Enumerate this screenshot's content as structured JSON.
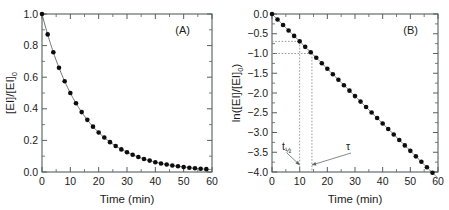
{
  "figure": {
    "background": "#ffffff",
    "marker_color": "#0d0d0d",
    "line_color": "#6b7272",
    "axis_color": "#555f5f"
  },
  "panelA": {
    "letter": "(A)",
    "xlabel": "Time (min)",
    "ylabel_main": "[EI]/[EI]",
    "ylabel_sub": "0",
    "xticklabels": [
      "0",
      "10",
      "20",
      "30",
      "40",
      "50",
      "60"
    ],
    "yticklabels": [
      "0.0",
      "0.2",
      "0.4",
      "0.6",
      "0.8",
      "1.0"
    ]
  },
  "panelB": {
    "letter": "(B)",
    "xlabel": "Time (min)",
    "ylabel_prefix": "ln([EI]/[EI]",
    "ylabel_sub": "0",
    "ylabel_suffix": ")",
    "xticklabels": [
      "0",
      "10",
      "20",
      "30",
      "40",
      "50",
      "60"
    ],
    "yticklabels": [
      "0.0",
      "-0.5",
      "-1.0",
      "-1.5",
      "-2.0",
      "-2.5",
      "-3.0",
      "-3.5",
      "-4.0"
    ],
    "annotations": [
      {
        "name": "half-life",
        "label_main": "t",
        "label_sub": "1/2",
        "value": 10.0,
        "guide_y": -0.693
      },
      {
        "name": "tau",
        "label_main": "τ",
        "label_sub": "",
        "value": 14.43,
        "guide_y": -1.0
      }
    ]
  },
  "chart_data": [
    {
      "type": "scatter",
      "panel": "A",
      "title": "(A)",
      "xlabel": "Time (min)",
      "ylabel": "[EI]/[EI]0",
      "xlim": [
        0,
        60
      ],
      "ylim": [
        0.0,
        1.0
      ],
      "xticks": [
        0,
        10,
        20,
        30,
        40,
        50,
        60
      ],
      "yticks": [
        0.0,
        0.2,
        0.4,
        0.6,
        0.8,
        1.0
      ],
      "grid": false,
      "legend": "none",
      "model": "[EI]/[EI]0 = exp(-t/tau), tau = 14.43 min",
      "x": [
        0,
        2,
        4,
        6,
        8,
        10,
        12,
        14,
        16,
        18,
        20,
        22,
        24,
        26,
        28,
        30,
        32,
        34,
        36,
        38,
        40,
        42,
        44,
        46,
        48,
        50,
        52,
        54,
        56,
        58
      ],
      "y": [
        1.0,
        0.871,
        0.758,
        0.66,
        0.574,
        0.5,
        0.435,
        0.379,
        0.33,
        0.287,
        0.25,
        0.218,
        0.189,
        0.165,
        0.143,
        0.125,
        0.109,
        0.095,
        0.082,
        0.072,
        0.062,
        0.054,
        0.047,
        0.041,
        0.036,
        0.031,
        0.027,
        0.024,
        0.021,
        0.018
      ]
    },
    {
      "type": "scatter",
      "panel": "B",
      "title": "(B)",
      "xlabel": "Time (min)",
      "ylabel": "ln([EI]/[EI]0)",
      "xlim": [
        0,
        60
      ],
      "ylim": [
        -4.0,
        0.0
      ],
      "xticks": [
        0,
        10,
        20,
        30,
        40,
        50,
        60
      ],
      "yticks": [
        0.0,
        -0.5,
        -1.0,
        -1.5,
        -2.0,
        -2.5,
        -3.0,
        -3.5,
        -4.0
      ],
      "grid": false,
      "legend": "none",
      "model": "ln([EI]/[EI]0) = -t/tau, slope = -0.0693 per min",
      "x": [
        0,
        2,
        4,
        6,
        8,
        10,
        12,
        14,
        16,
        18,
        20,
        22,
        24,
        26,
        28,
        30,
        32,
        34,
        36,
        38,
        40,
        42,
        44,
        46,
        48,
        50,
        52,
        54,
        56,
        58
      ],
      "y": [
        0.0,
        -0.139,
        -0.277,
        -0.416,
        -0.554,
        -0.693,
        -0.832,
        -0.97,
        -1.109,
        -1.247,
        -1.386,
        -1.525,
        -1.663,
        -1.802,
        -1.94,
        -2.079,
        -2.218,
        -2.356,
        -2.495,
        -2.633,
        -2.772,
        -2.911,
        -3.049,
        -3.188,
        -3.326,
        -3.465,
        -3.604,
        -3.742,
        -3.881,
        -4.019
      ]
    }
  ]
}
